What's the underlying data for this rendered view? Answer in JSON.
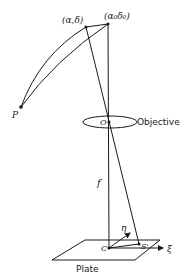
{
  "diagram": {
    "type": "astronomical-plate-projection",
    "labels": {
      "star_point": "(α,δ)",
      "plate_center_point": "(α₀δ₀)",
      "pole": "P",
      "objective_center": "O",
      "objective": "Objective",
      "focal_length": "f",
      "plate_center": "C",
      "star_image": "S'",
      "eta_axis": "η",
      "xi_axis": "ξ",
      "plate": "Plate"
    },
    "colors": {
      "stroke": "#1a1a1a",
      "background": "#ffffff"
    }
  }
}
